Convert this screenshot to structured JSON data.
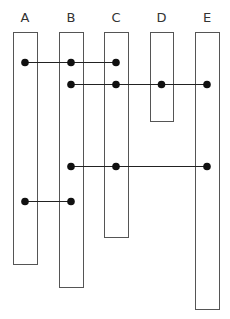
{
  "diagram": {
    "type": "sequence-lane-diagram",
    "lanes": [
      {
        "id": "A",
        "label": "A",
        "x": 13,
        "width": 24,
        "top": 32,
        "bottom": 264
      },
      {
        "id": "B",
        "label": "B",
        "x": 59,
        "width": 24,
        "top": 32,
        "bottom": 287
      },
      {
        "id": "C",
        "label": "C",
        "x": 104,
        "width": 24,
        "top": 32,
        "bottom": 237
      },
      {
        "id": "D",
        "label": "D",
        "x": 150,
        "width": 23,
        "top": 32,
        "bottom": 121
      },
      {
        "id": "E",
        "label": "E",
        "x": 195,
        "width": 24,
        "top": 32,
        "bottom": 309
      }
    ],
    "connections": [
      {
        "y": 62,
        "lanes": [
          "A",
          "B",
          "C"
        ]
      },
      {
        "y": 84,
        "lanes": [
          "B",
          "C",
          "D",
          "E"
        ]
      },
      {
        "y": 166,
        "lanes": [
          "B",
          "C",
          "E"
        ]
      },
      {
        "y": 201,
        "lanes": [
          "A",
          "B"
        ]
      }
    ],
    "colors": {
      "lane_stroke": "#555555",
      "dot": "#111111",
      "line": "#222222",
      "label": "#333333"
    }
  }
}
